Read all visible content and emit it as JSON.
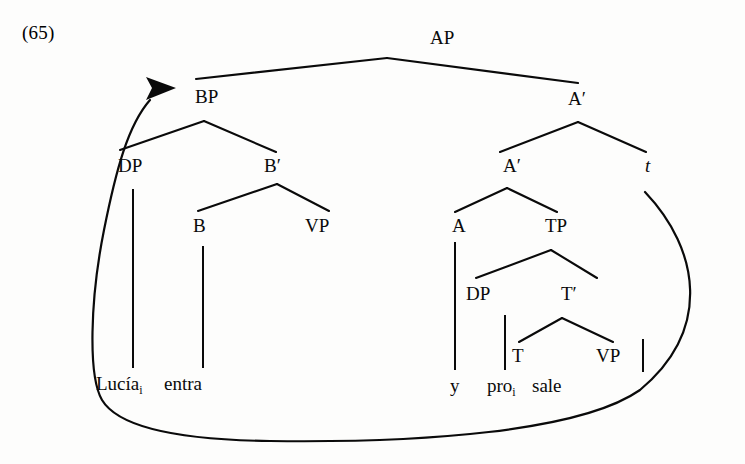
{
  "figure": {
    "example_number": "(65)",
    "caption_text": "",
    "ink_color": "#0a0a0a",
    "background_color": "#fdfdfc"
  },
  "tree": {
    "nodes": [
      {
        "id": "AP",
        "label": "AP",
        "x": 430,
        "y": 44,
        "italic": false
      },
      {
        "id": "BP",
        "label": "BP",
        "x": 195,
        "y": 103,
        "italic": false
      },
      {
        "id": "Abar1",
        "label": "A′",
        "x": 568,
        "y": 105,
        "italic": false
      },
      {
        "id": "DP1",
        "label": "DP",
        "x": 118,
        "y": 172,
        "italic": false
      },
      {
        "id": "Bbar",
        "label": "B′",
        "x": 264,
        "y": 172,
        "italic": false
      },
      {
        "id": "Abar2",
        "label": "A′",
        "x": 503,
        "y": 172,
        "italic": false
      },
      {
        "id": "trace",
        "label": "t",
        "x": 645,
        "y": 172,
        "italic": true
      },
      {
        "id": "B",
        "label": "B",
        "x": 193,
        "y": 232,
        "italic": false
      },
      {
        "id": "VP1",
        "label": "VP",
        "x": 305,
        "y": 232,
        "italic": false
      },
      {
        "id": "A",
        "label": "A",
        "x": 452,
        "y": 232,
        "italic": false
      },
      {
        "id": "TP",
        "label": "TP",
        "x": 545,
        "y": 232,
        "italic": false
      },
      {
        "id": "DP2",
        "label": "DP",
        "x": 466,
        "y": 300,
        "italic": false
      },
      {
        "id": "Tbar",
        "label": "T′",
        "x": 561,
        "y": 300,
        "italic": false
      },
      {
        "id": "T",
        "label": "T",
        "x": 512,
        "y": 362,
        "italic": false
      },
      {
        "id": "VP2",
        "label": "VP",
        "x": 596,
        "y": 362,
        "italic": false
      }
    ],
    "branches": [
      {
        "name": "ap-to-bp",
        "x1": 387,
        "y1": 58,
        "x2": 196,
        "y2": 79
      },
      {
        "name": "ap-to-abar1",
        "x1": 387,
        "y1": 58,
        "x2": 578,
        "y2": 83
      },
      {
        "name": "bp-to-dp1",
        "x1": 204,
        "y1": 121,
        "x2": 120,
        "y2": 150
      },
      {
        "name": "bp-to-bbar",
        "x1": 204,
        "y1": 121,
        "x2": 276,
        "y2": 152
      },
      {
        "name": "bbar-to-b",
        "x1": 277,
        "y1": 184,
        "x2": 198,
        "y2": 211
      },
      {
        "name": "bbar-to-vp1",
        "x1": 277,
        "y1": 184,
        "x2": 329,
        "y2": 211
      },
      {
        "name": "abar1-to-abar2",
        "x1": 578,
        "y1": 122,
        "x2": 500,
        "y2": 152
      },
      {
        "name": "abar1-to-trace",
        "x1": 578,
        "y1": 122,
        "x2": 646,
        "y2": 152
      },
      {
        "name": "abar2-to-a",
        "x1": 507,
        "y1": 188,
        "x2": 455,
        "y2": 212
      },
      {
        "name": "abar2-to-tp",
        "x1": 507,
        "y1": 188,
        "x2": 557,
        "y2": 212
      },
      {
        "name": "tp-to-dp2",
        "x1": 551,
        "y1": 250,
        "x2": 476,
        "y2": 278
      },
      {
        "name": "tp-to-tbar",
        "x1": 551,
        "y1": 250,
        "x2": 597,
        "y2": 278
      },
      {
        "name": "tbar-to-t",
        "x1": 562,
        "y1": 318,
        "x2": 519,
        "y2": 342
      },
      {
        "name": "tbar-to-vp2",
        "x1": 562,
        "y1": 318,
        "x2": 613,
        "y2": 342
      }
    ],
    "stems": [
      {
        "name": "dp1-to-lucia",
        "x1": 133,
        "y1": 189,
        "x2": 133,
        "y2": 368
      },
      {
        "name": "b-to-entra",
        "x1": 203,
        "y1": 246,
        "x2": 203,
        "y2": 368
      },
      {
        "name": "a-to-y",
        "x1": 455,
        "y1": 242,
        "x2": 455,
        "y2": 370
      },
      {
        "name": "dp2-to-pro",
        "x1": 505,
        "y1": 315,
        "x2": 505,
        "y2": 370
      },
      {
        "name": "vp2-to-sale",
        "x1": 643,
        "y1": 339,
        "x2": 643,
        "y2": 372
      }
    ],
    "leaves": [
      {
        "id": "lucia",
        "text": "Lucía",
        "subscript": "i",
        "x": 96,
        "y": 390
      },
      {
        "id": "entra",
        "text": "entra",
        "subscript": "",
        "x": 164,
        "y": 390
      },
      {
        "id": "y",
        "text": "y",
        "subscript": "",
        "x": 450,
        "y": 392
      },
      {
        "id": "pro",
        "text": "pro",
        "subscript": "i",
        "x": 487,
        "y": 392
      },
      {
        "id": "sale",
        "text": "sale",
        "subscript": "",
        "x": 532,
        "y": 392
      }
    ],
    "movement_arc": {
      "name": "movement-arrow-bp-to-trace",
      "path": "M 645 192 C 700 250, 712 330, 640 390 C 580 432, 420 443, 270 441 C 190 440, 120 430, 102 400 C 88 376, 90 300, 104 230 C 116 170, 128 125, 150 100",
      "arrow_head_points": "176,88 146,77 152,88 146,100"
    }
  },
  "annotations": {
    "tree_description": "AP branching into BP and A-bar; BP into DP and B-bar; B-bar into B and VP; A-bar into A-bar and trace t; inner A-bar into A and TP; TP into DP and T-bar; T-bar into T and VP",
    "movement_description": "Arrow from trace position curving around the bottom up to BP"
  }
}
